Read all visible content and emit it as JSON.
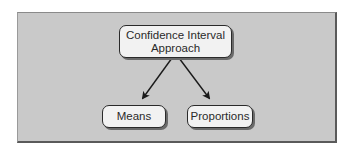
{
  "diagram": {
    "type": "tree",
    "root": {
      "label_line1": "Confidence Interval",
      "label_line2": "Approach"
    },
    "children": [
      {
        "label": "Means"
      },
      {
        "label": "Proportions"
      }
    ],
    "edges": [
      {
        "from": "Confidence Interval Approach",
        "to": "Means"
      },
      {
        "from": "Confidence Interval Approach",
        "to": "Proportions"
      }
    ]
  },
  "colors": {
    "panel_background": "#c9c9c9",
    "node_fill": "#f2f2f2",
    "stroke": "#2a2a2a"
  }
}
